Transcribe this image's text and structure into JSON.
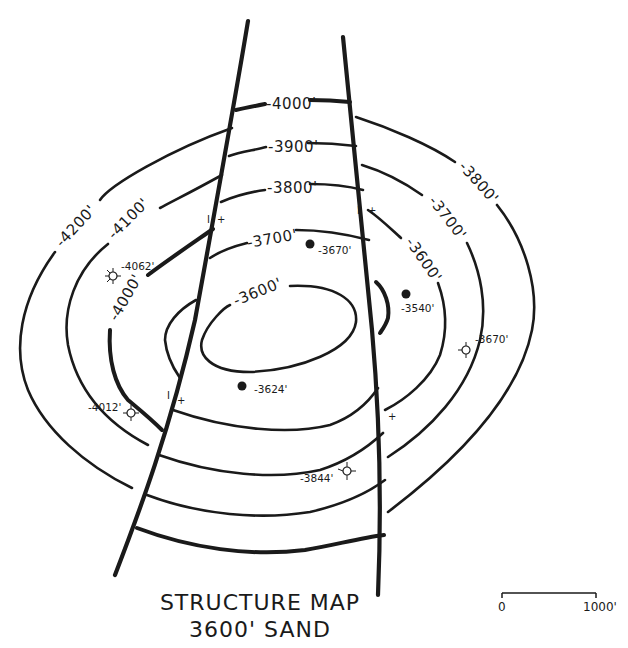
{
  "title": {
    "line1": "STRUCTURE MAP",
    "line2": "3600' SAND"
  },
  "scale_bar": {
    "start_label": "0",
    "end_label": "1000'"
  },
  "contour_labels": {
    "c4000_top": "-4000'",
    "c3900": "-3900'",
    "c3800_center": "-3800'",
    "c3700_center": "-3700'",
    "c3600_center": "-3600'",
    "c4200_left": "-4200'",
    "c4100_left": "-4100'",
    "c4000_left": "-4000'",
    "c3800_right": "-3800'",
    "c3700_right": "-3700'",
    "c3600_right": "-3600'"
  },
  "wells": [
    {
      "id": "w1",
      "type": "producer",
      "depth_label": "-3670'"
    },
    {
      "id": "w2",
      "type": "producer",
      "depth_label": "-3540'"
    },
    {
      "id": "w3",
      "type": "producer",
      "depth_label": "-3624'"
    },
    {
      "id": "w4",
      "type": "dry-hole",
      "depth_label": "-4062'"
    },
    {
      "id": "w5",
      "type": "dry-hole",
      "depth_label": "-4012'"
    },
    {
      "id": "w6",
      "type": "dry-hole",
      "depth_label": "-3670'"
    },
    {
      "id": "w7",
      "type": "dry-hole",
      "depth_label": "-3844'"
    }
  ],
  "fault_markers": {
    "downthrown": "I",
    "upthrown": "+"
  },
  "colors": {
    "ink": "#1a1a1a",
    "paper": "#ffffff"
  }
}
